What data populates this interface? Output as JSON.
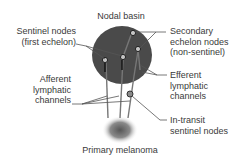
{
  "diagram": {
    "title": "Nodal basin",
    "labels": {
      "sentinel_nodes": [
        "Sentinel nodes",
        "(first echelon)"
      ],
      "secondary_nodes": [
        "Secondary",
        "echelon nodes",
        "(non-sentinel)"
      ],
      "afferent": [
        "Afferent",
        "lymphatic",
        "channels"
      ],
      "efferent": [
        "Efferent",
        "lymphatic",
        "channels"
      ],
      "in_transit": [
        "In-transit",
        "sentinel nodes"
      ],
      "primary": "Primary melanoma"
    },
    "colors": {
      "basin": "#4a4a4a",
      "lines": "#6a6a6a",
      "node": "#bdbdbd",
      "text": "#3a3a3a"
    }
  }
}
